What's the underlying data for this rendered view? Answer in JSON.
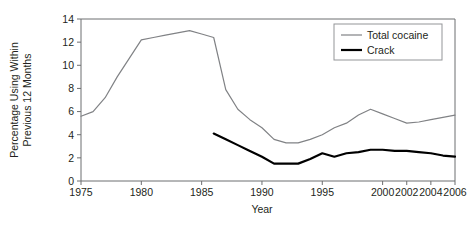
{
  "chart_data": {
    "type": "line",
    "title": "",
    "xlabel": "Year",
    "ylabel": "Percentage Using Within Previous 12 Months",
    "ylabel_line1": "Percentage Using Within",
    "ylabel_line2": "Previous 12 Months",
    "xlim": [
      1975,
      2006
    ],
    "ylim": [
      0,
      14
    ],
    "grid": false,
    "legend_position": "top-right",
    "x_ticks": [
      1975,
      1980,
      1985,
      1990,
      1995,
      2000,
      2002,
      2004,
      2006
    ],
    "x_tick_labels": [
      "1975",
      "1980",
      "1985",
      "1990",
      "1995",
      "2000",
      "2002",
      "2004",
      "2006"
    ],
    "y_ticks": [
      0,
      2,
      4,
      6,
      8,
      10,
      12,
      14
    ],
    "y_tick_labels": [
      "0",
      "2",
      "4",
      "6",
      "8",
      "10",
      "12",
      "14"
    ],
    "series": [
      {
        "name": "Total cocaine",
        "color": "#808285",
        "width": 1.2,
        "x": [
          1975,
          1976,
          1977,
          1978,
          1979,
          1980,
          1981,
          1982,
          1983,
          1984,
          1985,
          1986,
          1987,
          1988,
          1989,
          1990,
          1991,
          1992,
          1993,
          1994,
          1995,
          1996,
          1997,
          1998,
          1999,
          2000,
          2001,
          2002,
          2003,
          2004,
          2005,
          2006
        ],
        "values": [
          5.6,
          6.0,
          7.2,
          9.0,
          10.6,
          12.2,
          12.4,
          12.6,
          12.8,
          13.0,
          12.7,
          12.4,
          7.9,
          6.2,
          5.3,
          4.6,
          3.6,
          3.3,
          3.3,
          3.6,
          4.0,
          4.6,
          5.0,
          5.7,
          6.2,
          5.8,
          5.4,
          5.0,
          5.1,
          5.3,
          5.5,
          5.7
        ]
      },
      {
        "name": "Crack",
        "color": "#000000",
        "width": 2.2,
        "x": [
          1986,
          1987,
          1988,
          1989,
          1990,
          1991,
          1992,
          1993,
          1994,
          1995,
          1996,
          1997,
          1998,
          1999,
          2000,
          2001,
          2002,
          2003,
          2004,
          2005,
          2006
        ],
        "values": [
          4.1,
          3.6,
          3.1,
          2.6,
          2.1,
          1.5,
          1.5,
          1.5,
          1.9,
          2.4,
          2.1,
          2.4,
          2.5,
          2.7,
          2.7,
          2.6,
          2.6,
          2.5,
          2.4,
          2.2,
          2.1
        ]
      }
    ],
    "legend_entries": [
      {
        "label": "Total cocaine",
        "color": "#808285",
        "width": 1.2
      },
      {
        "label": "Crack",
        "color": "#000000",
        "width": 2.2
      }
    ]
  }
}
